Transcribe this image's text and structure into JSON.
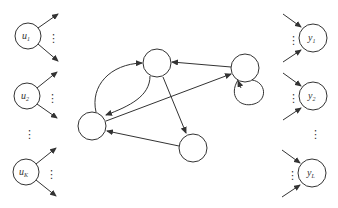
{
  "diagram": {
    "type": "recurrent-network",
    "stroke_color": "#333333",
    "inputs": [
      {
        "id": "u1",
        "label": "u",
        "sub": "1",
        "cx": 28,
        "cy": 36
      },
      {
        "id": "u2",
        "label": "u",
        "sub": "2",
        "cx": 27,
        "cy": 96
      },
      {
        "id": "uK",
        "label": "u",
        "sub": "K",
        "cx": 26,
        "cy": 172
      }
    ],
    "outputs": [
      {
        "id": "y1",
        "label": "y",
        "sub": "1",
        "cx": 313,
        "cy": 38
      },
      {
        "id": "y2",
        "label": "y",
        "sub": "2",
        "cx": 313,
        "cy": 96
      },
      {
        "id": "yL",
        "label": "y",
        "sub": "L",
        "cx": 312,
        "cy": 173
      }
    ],
    "hidden": [
      {
        "id": "top",
        "cx": 157,
        "cy": 63
      },
      {
        "id": "right",
        "cx": 245,
        "cy": 68
      },
      {
        "id": "left",
        "cx": 92,
        "cy": 126
      },
      {
        "id": "bottom",
        "cx": 193,
        "cy": 148
      }
    ],
    "ellipsis": "⋮"
  }
}
